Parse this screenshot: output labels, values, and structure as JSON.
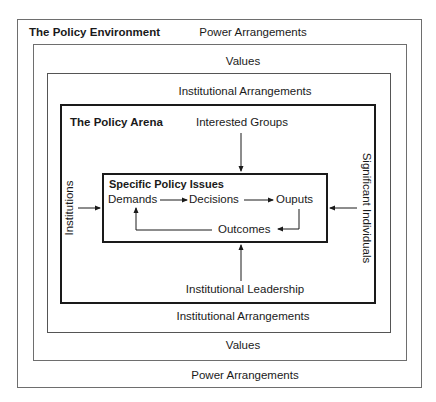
{
  "diagram": {
    "environment": {
      "title": "The Policy Environment",
      "outer_top": "Power Arrangements",
      "outer_bottom": "Power Arrangements",
      "values_top": "Values",
      "values_bottom": "Values",
      "institutional_top": "Institutional Arrangements",
      "institutional_bottom": "Institutional Arrangements"
    },
    "arena": {
      "title": "The Policy Arena",
      "top_input": "Interested Groups",
      "bottom_input": "Institutional Leadership",
      "left_input": "Institutions",
      "right_input": "Significant Individuals"
    },
    "issues": {
      "title": "Specific Policy Issues",
      "nodes": [
        "Demands",
        "Decisions",
        "Ouputs",
        "Outcomes"
      ]
    }
  }
}
